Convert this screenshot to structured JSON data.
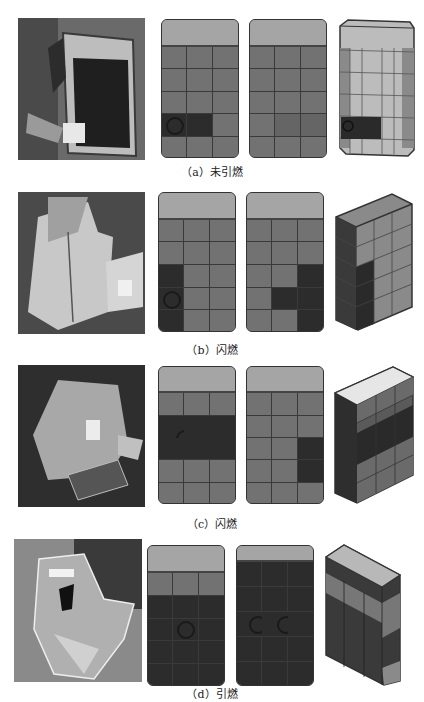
{
  "figure": {
    "panels": [
      {
        "id": "a",
        "caption": "（a）未引燃",
        "face1": [
          "m",
          "m",
          "m",
          "m",
          "m",
          "m",
          "m",
          "m",
          "m",
          "d",
          "d",
          "m",
          "m",
          "m",
          "m"
        ],
        "face1_rings": [
          9
        ],
        "face2": [
          "m",
          "m",
          "m",
          "m",
          "m",
          "m",
          "m",
          "m",
          "m",
          "m",
          "m",
          "m",
          "m",
          "m",
          "m"
        ],
        "face2_rings": [],
        "box_style": "transparent-light"
      },
      {
        "id": "b",
        "caption": "（b）闪燃",
        "face1": [
          "m",
          "m",
          "m",
          "m",
          "m",
          "m",
          "d",
          "m",
          "m",
          "d",
          "m",
          "m",
          "d",
          "m",
          "m"
        ],
        "face1_rings": [
          9
        ],
        "face2": [
          "m",
          "m",
          "m",
          "m",
          "m",
          "m",
          "m",
          "m",
          "d",
          "m",
          "d",
          "d",
          "m",
          "m",
          "d"
        ],
        "face2_rings": [],
        "box_style": "transparent-dark-left"
      },
      {
        "id": "c",
        "caption": "（c）闪燃",
        "face1": [
          "m",
          "m",
          "m",
          "d",
          "d",
          "d",
          "d",
          "d",
          "d",
          "m",
          "m",
          "m",
          "m",
          "m",
          "m"
        ],
        "face1_rings": [
          3
        ],
        "face2": [
          "m",
          "m",
          "m",
          "m",
          "m",
          "m",
          "m",
          "m",
          "d",
          "m",
          "m",
          "d",
          "m",
          "m",
          "m"
        ],
        "face2_rings": [],
        "box_style": "solid-dark-band"
      },
      {
        "id": "d",
        "caption": "（d）引燃",
        "face1": [
          "m",
          "m",
          "m",
          "d",
          "d",
          "d",
          "d",
          "d",
          "d",
          "d",
          "d",
          "d",
          "d",
          "d",
          "d"
        ],
        "face1_rings": [
          7
        ],
        "face2": [
          "d",
          "d",
          "d",
          "d",
          "d",
          "d",
          "d",
          "d",
          "d",
          "d",
          "d",
          "d",
          "d",
          "d",
          "d"
        ],
        "face2_rings": [
          6,
          7
        ],
        "box_style": "transparent-dark"
      }
    ]
  }
}
